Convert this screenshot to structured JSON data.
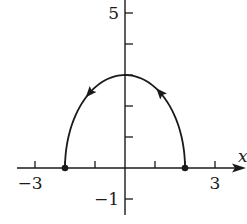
{
  "chart_data": {
    "type": "line",
    "title": "",
    "xlabel": "x",
    "ylabel": "",
    "x_tick_labels": [
      {
        "value": -3,
        "label": "−3"
      },
      {
        "value": 3,
        "label": "3"
      }
    ],
    "y_tick_labels": [
      {
        "value": 5,
        "label": "5"
      },
      {
        "value": -1,
        "label": "−1"
      }
    ],
    "x_ticks": [
      -3,
      -2,
      -1,
      1,
      2,
      3
    ],
    "y_ticks": [
      -1,
      1,
      2,
      3,
      4,
      5
    ],
    "xlim": [
      -3.6,
      4.0
    ],
    "ylim": [
      -1.5,
      5.4
    ],
    "grid": false,
    "series": [
      {
        "name": "parametric curve",
        "description": "upper half of ellipse x^2/4 + y^2/9 = 1, traced counterclockwise from (2,0) to (-2,0)",
        "x_semi_axis": 2,
        "y_semi_axis": 3,
        "start": [
          2,
          0
        ],
        "end": [
          -2,
          0
        ],
        "direction": "counterclockwise",
        "endpoints_marked": true,
        "points": [
          [
            2,
            0
          ],
          [
            1.9,
            0.94
          ],
          [
            1.73,
            1.5
          ],
          [
            1.41,
            2.12
          ],
          [
            1,
            2.6
          ],
          [
            0.52,
            2.9
          ],
          [
            0,
            3
          ],
          [
            -0.52,
            2.9
          ],
          [
            -1,
            2.6
          ],
          [
            -1.41,
            2.12
          ],
          [
            -1.73,
            1.5
          ],
          [
            -1.9,
            0.94
          ],
          [
            -2,
            0
          ]
        ]
      }
    ]
  },
  "colors": {
    "ink": "#1a1a1a",
    "background": "#ffffff"
  }
}
